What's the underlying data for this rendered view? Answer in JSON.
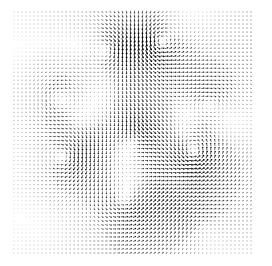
{
  "figure": {
    "title": "",
    "background_color": "#ffffff",
    "width": 272,
    "height": 266
  },
  "chart_data": {
    "type": "quiver",
    "title": "",
    "subtitle": "",
    "xlabel": "",
    "ylabel": "",
    "legend": [],
    "annotations": [],
    "grid": false,
    "axes_visible": false,
    "tick_labels_x": [],
    "tick_labels_y": [],
    "arrow_color": "#000000",
    "background_color": "#ffffff",
    "plot_area": {
      "x": 14,
      "y": 12,
      "width": 237,
      "height": 241
    },
    "grid_spacing_px": 4.0,
    "grid_cols": 60,
    "grid_rows": 61,
    "xlim": [
      0,
      1
    ],
    "ylim": [
      0,
      1
    ],
    "arrow_max_length_px": 4.4,
    "arrow_head_fraction": 0.38,
    "line_width_px": 0.9,
    "field_description": "Two-dimensional incompressible-looking vector field rendered as a dense quiver grid of small black arrows; arrow length and darkness encode local speed. Field is built as a superposition of point vortices, sources/sinks and a weak uniform background flow.",
    "background_flow": {
      "u": 0.3,
      "v": -0.02
    },
    "features": [
      {
        "name": "vortex-top-right",
        "kind": "vortex",
        "x": 0.615,
        "y": 0.128,
        "strength": -0.155,
        "core": 0.052
      },
      {
        "name": "vortex-top-center",
        "kind": "vortex",
        "x": 0.4,
        "y": 0.155,
        "strength": 0.115,
        "core": 0.055
      },
      {
        "name": "saddle-center",
        "kind": "saddle",
        "x": 0.51,
        "y": 0.522,
        "strength": 0.13,
        "core": 0.06
      },
      {
        "name": "vortex-left-upper",
        "kind": "vortex",
        "x": 0.195,
        "y": 0.36,
        "strength": -0.12,
        "core": 0.07
      },
      {
        "name": "vortex-left-lower",
        "kind": "vortex",
        "x": 0.215,
        "y": 0.6,
        "strength": 0.15,
        "core": 0.065
      },
      {
        "name": "vortex-right-middle",
        "kind": "vortex",
        "x": 0.76,
        "y": 0.585,
        "strength": -0.165,
        "core": 0.055
      },
      {
        "name": "vortex-right-upper",
        "kind": "vortex",
        "x": 0.82,
        "y": 0.38,
        "strength": 0.095,
        "core": 0.06
      },
      {
        "name": "vortex-bottom-center",
        "kind": "vortex",
        "x": 0.47,
        "y": 0.79,
        "strength": -0.11,
        "core": 0.065
      },
      {
        "name": "source-center-left",
        "kind": "source",
        "x": 0.33,
        "y": 0.47,
        "strength": 0.06,
        "core": 0.08
      },
      {
        "name": "sink-center-right",
        "kind": "source",
        "x": 0.64,
        "y": 0.7,
        "strength": -0.07,
        "core": 0.08
      },
      {
        "name": "vortex-bottom-right",
        "kind": "vortex",
        "x": 0.78,
        "y": 0.88,
        "strength": 0.085,
        "core": 0.075
      },
      {
        "name": "vortex-top-left",
        "kind": "vortex",
        "x": 0.13,
        "y": 0.13,
        "strength": 0.045,
        "core": 0.09
      }
    ],
    "wave_modulation": {
      "amplitude_u": 0.085,
      "amplitude_v": 0.085,
      "kx": 6.2,
      "ky": 5.4,
      "phase_u": 0.7,
      "phase_v": 2.1
    },
    "edge_falloff": {
      "enabled": true,
      "margin": 0.055,
      "corner_damping": 0.45,
      "description": "Arrow magnitudes fade toward the top-left and bottom-right image corners, leaving faint dotted arrows at the border."
    }
  }
}
